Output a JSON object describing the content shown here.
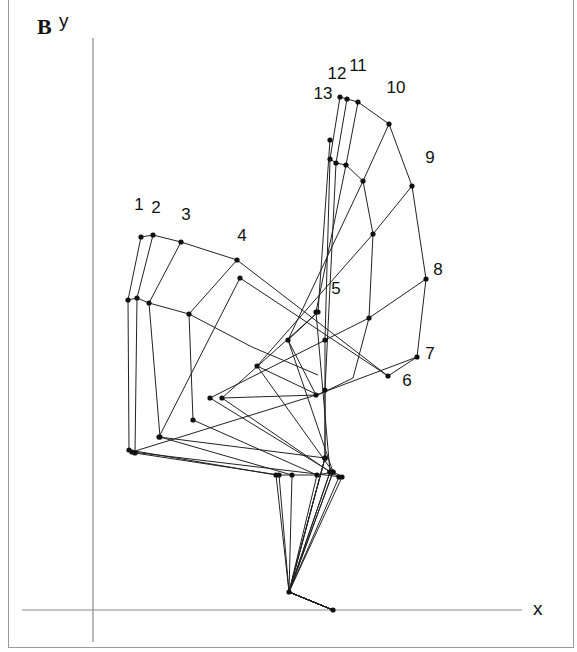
{
  "panel": {
    "label": "B"
  },
  "axes": {
    "x_label": "x",
    "y_label": "y",
    "x_axis": {
      "x1": 22,
      "x2": 522,
      "y": 610
    },
    "y_axis": {
      "x": 93,
      "y1": 38,
      "y2": 642
    },
    "color": "#8a8a8a"
  },
  "style": {
    "line_color": "#222222",
    "dot_color": "#111111",
    "dot_radius": 2.6
  },
  "toe": {
    "x": 333,
    "y": 610
  },
  "ankle": {
    "x": 289,
    "y": 592
  },
  "frames": [
    {
      "n": "1",
      "label_pos": [
        139,
        205
      ],
      "points": [
        [
          141,
          237
        ],
        [
          128,
          300
        ],
        [
          129,
          450
        ],
        [
          276,
          475
        ]
      ]
    },
    {
      "n": "2",
      "label_pos": [
        156,
        208
      ],
      "points": [
        [
          153,
          235
        ],
        [
          137,
          298
        ],
        [
          135,
          453
        ],
        [
          279,
          475
        ]
      ]
    },
    {
      "n": "3",
      "label_pos": [
        186,
        215
      ],
      "points": [
        [
          181,
          242
        ],
        [
          149,
          303
        ],
        [
          160,
          437
        ],
        [
          292,
          475
        ]
      ]
    },
    {
      "n": "4",
      "label_pos": [
        242,
        236
      ],
      "points": [
        [
          237,
          260
        ],
        [
          189,
          314
        ],
        [
          193,
          420
        ],
        [
          317,
          475
        ]
      ]
    },
    {
      "n": "5",
      "label_pos": [
        336,
        289
      ],
      "points": [
        [
          330,
          140
        ],
        [
          318,
          312
        ],
        [
          222,
          398
        ],
        [
          330,
          472
        ]
      ]
    },
    {
      "n": "6",
      "label_pos": [
        407,
        381
      ],
      "points": [
        [
          388,
          376
        ],
        [
          240,
          278
        ],
        [
          159,
          437
        ],
        [
          325,
          458
        ]
      ]
    },
    {
      "n": "7",
      "label_pos": [
        430,
        354
      ],
      "points": [
        [
          417,
          357
        ],
        [
          316,
          395
        ],
        [
          132,
          452
        ],
        [
          342,
          477
        ]
      ]
    },
    {
      "n": "8",
      "label_pos": [
        438,
        270
      ],
      "points": [
        [
          426,
          279
        ],
        [
          369,
          318
        ],
        [
          210,
          398
        ],
        [
          339,
          477
        ]
      ]
    },
    {
      "n": "9",
      "label_pos": [
        430,
        158
      ],
      "points": [
        [
          412,
          186
        ],
        [
          373,
          234
        ],
        [
          257,
          366
        ],
        [
          333,
          472
        ]
      ]
    },
    {
      "n": "10",
      "label_pos": [
        396,
        88
      ],
      "points": [
        [
          389,
          124
        ],
        [
          363,
          181
        ],
        [
          288,
          340
        ],
        [
          333,
          472
        ]
      ]
    },
    {
      "n": "11",
      "label_pos": [
        358,
        66
      ],
      "points": [
        [
          358,
          102
        ],
        [
          346,
          165
        ],
        [
          316,
          312
        ],
        [
          330,
          472
        ]
      ]
    },
    {
      "n": "12",
      "label_pos": [
        337,
        74
      ],
      "points": [
        [
          347,
          99
        ],
        [
          336,
          163
        ],
        [
          325,
          390
        ],
        [
          325,
          458
        ]
      ]
    },
    {
      "n": "13",
      "label_pos": [
        323,
        94
      ],
      "points": [
        [
          340,
          97
        ],
        [
          330,
          159
        ],
        [
          325,
          340
        ],
        [
          325,
          458
        ]
      ]
    }
  ],
  "extra_segments": [
    [
      [
        128,
        300
      ],
      [
        137,
        298
      ]
    ],
    [
      [
        137,
        298
      ],
      [
        149,
        303
      ]
    ],
    [
      [
        149,
        303
      ],
      [
        189,
        314
      ]
    ],
    [
      [
        189,
        314
      ],
      [
        252,
        347
      ]
    ],
    [
      [
        252,
        347
      ],
      [
        318,
        375
      ]
    ],
    [
      [
        330,
        159
      ],
      [
        336,
        163
      ]
    ],
    [
      [
        336,
        163
      ],
      [
        346,
        165
      ]
    ],
    [
      [
        346,
        165
      ],
      [
        363,
        181
      ]
    ],
    [
      [
        363,
        181
      ],
      [
        373,
        234
      ]
    ],
    [
      [
        373,
        234
      ],
      [
        369,
        318
      ]
    ],
    [
      [
        369,
        318
      ],
      [
        353,
        378
      ]
    ],
    [
      [
        353,
        378
      ],
      [
        318,
        395
      ]
    ],
    [
      [
        141,
        237
      ],
      [
        153,
        235
      ]
    ],
    [
      [
        153,
        235
      ],
      [
        181,
        242
      ]
    ],
    [
      [
        181,
        242
      ],
      [
        237,
        260
      ]
    ],
    [
      [
        237,
        260
      ],
      [
        388,
        376
      ]
    ],
    [
      [
        340,
        97
      ],
      [
        347,
        99
      ]
    ],
    [
      [
        347,
        99
      ],
      [
        358,
        102
      ]
    ],
    [
      [
        358,
        102
      ],
      [
        389,
        124
      ]
    ],
    [
      [
        389,
        124
      ],
      [
        412,
        186
      ]
    ],
    [
      [
        412,
        186
      ],
      [
        426,
        279
      ]
    ],
    [
      [
        426,
        279
      ],
      [
        417,
        357
      ]
    ],
    [
      [
        417,
        357
      ],
      [
        388,
        376
      ]
    ],
    [
      [
        276,
        475
      ],
      [
        292,
        475
      ]
    ],
    [
      [
        292,
        475
      ],
      [
        317,
        475
      ]
    ],
    [
      [
        317,
        475
      ],
      [
        333,
        472
      ]
    ],
    [
      [
        333,
        472
      ],
      [
        343,
        477
      ]
    ],
    [
      [
        288,
        340
      ],
      [
        318,
        312
      ]
    ],
    [
      [
        288,
        340
      ],
      [
        316,
        395
      ]
    ],
    [
      [
        257,
        366
      ],
      [
        318,
        395
      ]
    ],
    [
      [
        222,
        398
      ],
      [
        317,
        395
      ]
    ]
  ]
}
